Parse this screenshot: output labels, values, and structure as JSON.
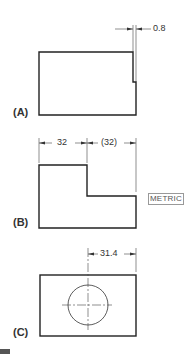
{
  "figures": [
    {
      "label": "(A)",
      "dimension": "0.8"
    },
    {
      "label": "(B)",
      "dimensions": [
        "32",
        "(32)"
      ],
      "note": "METRIC"
    },
    {
      "label": "(C)",
      "dimension": "31.4"
    }
  ],
  "colors": {
    "line": "#222222",
    "thin": "#444444",
    "text": "#333333"
  }
}
